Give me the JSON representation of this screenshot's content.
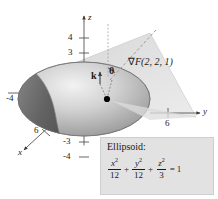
{
  "figure": {
    "background": "#ffffff",
    "axes": {
      "z_label": "z",
      "y_label": "y",
      "x_label": "x",
      "z_ticks_positive": [
        "4",
        "3"
      ],
      "z_ticks_negative": [
        "-3",
        "-4"
      ],
      "y_tick": "6",
      "x_tick": "6",
      "x_negative_tick": "-4"
    },
    "annotations": {
      "gradient_label": "F(2, 2, 1)",
      "gradient_symbol": "∇",
      "unit_vector": "k",
      "angle": "θ"
    },
    "equation_box": {
      "title": "Ellipsoid:",
      "terms": [
        {
          "numerator": "x",
          "exponent": "2",
          "denominator": "12"
        },
        {
          "numerator": "y",
          "exponent": "2",
          "denominator": "12"
        },
        {
          "numerator": "z",
          "exponent": "2",
          "denominator": "3"
        }
      ],
      "operator": "+",
      "equals": "=",
      "result": "1",
      "fill_color": "#e2e2e2"
    },
    "colors": {
      "ellipsoid_dark": "#6e6e6e",
      "ellipsoid_light": "#c9c9c9",
      "plane": "#dcdcdc",
      "axis": "#555555",
      "point": "#000000"
    }
  }
}
